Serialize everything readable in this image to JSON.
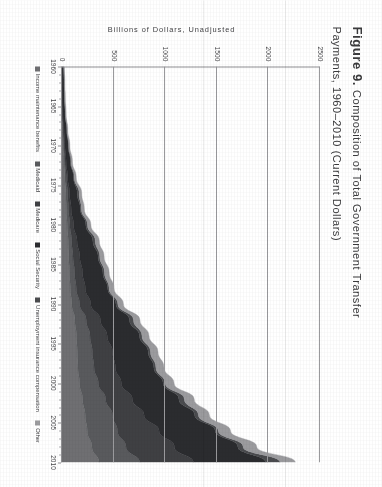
{
  "figure": {
    "number_label": "Figure 9.",
    "title_part_1": "Composition of Total Government Transfer",
    "title_part_2": "Payments, 1960–2010 (Current Dollars)"
  },
  "chart_data": {
    "type": "area",
    "stacked": true,
    "title": "Figure 9. Composition of Total Government Transfer Payments, 1960–2010 (Current Dollars)",
    "xlabel": "",
    "ylabel": "Billions of Dollars, Unadjusted",
    "ylim": [
      0,
      2500
    ],
    "xlim": [
      1960,
      2010
    ],
    "grid": "horizontal",
    "legend_position": "bottom",
    "y_ticks": [
      0,
      500,
      1000,
      1500,
      2000,
      2500
    ],
    "y_tick_labels": [
      "0",
      "500",
      "1000",
      "1500",
      "2000",
      "2500"
    ],
    "x_ticks": [
      1960,
      1965,
      1970,
      1975,
      1980,
      1985,
      1990,
      1995,
      2000,
      2005,
      2010
    ],
    "x_tick_labels": [
      "1960",
      "1965",
      "1970",
      "1975",
      "1980",
      "1985",
      "1990",
      "1995",
      "2000",
      "2005",
      "2010"
    ],
    "x": [
      1960,
      1962,
      1964,
      1966,
      1968,
      1970,
      1972,
      1974,
      1976,
      1978,
      1980,
      1982,
      1984,
      1986,
      1988,
      1990,
      1992,
      1994,
      1996,
      1998,
      2000,
      2002,
      2004,
      2006,
      2008,
      2010
    ],
    "series": [
      {
        "name": "Income maintenance benefits",
        "color": "#6f6f72",
        "values": [
          4,
          5,
          6,
          7,
          10,
          15,
          21,
          28,
          38,
          42,
          50,
          60,
          66,
          73,
          80,
          95,
          125,
          140,
          148,
          155,
          170,
          200,
          225,
          245,
          290,
          360
        ]
      },
      {
        "name": "Medicaid",
        "color": "#595a5d",
        "values": [
          0,
          0,
          0,
          1,
          4,
          6,
          9,
          13,
          17,
          21,
          27,
          34,
          41,
          49,
          58,
          76,
          110,
          132,
          146,
          156,
          183,
          224,
          265,
          293,
          331,
          395
        ]
      },
      {
        "name": "Medicare",
        "color": "#3f4043",
        "values": [
          0,
          0,
          0,
          2,
          6,
          8,
          10,
          15,
          19,
          26,
          36,
          52,
          66,
          77,
          88,
          108,
          138,
          166,
          196,
          207,
          222,
          259,
          306,
          403,
          468,
          520
        ]
      },
      {
        "name": "Social Security",
        "color": "#2b2c2f",
        "values": [
          11,
          15,
          17,
          21,
          26,
          32,
          41,
          56,
          74,
          89,
          118,
          153,
          177,
          197,
          217,
          244,
          281,
          313,
          345,
          372,
          405,
          450,
          490,
          544,
          615,
          700
        ]
      },
      {
        "name": "Unemployment insurance compensation",
        "color": "#4a4b4e",
        "values": [
          3,
          3,
          3,
          2,
          2,
          4,
          6,
          7,
          18,
          10,
          16,
          24,
          16,
          16,
          13,
          18,
          39,
          24,
          22,
          20,
          21,
          53,
          36,
          30,
          51,
          139
        ]
      },
      {
        "name": "Other",
        "color": "#9b9b9e",
        "values": [
          4,
          5,
          6,
          7,
          9,
          11,
          14,
          19,
          25,
          28,
          33,
          38,
          42,
          45,
          48,
          54,
          62,
          68,
          73,
          78,
          85,
          95,
          106,
          118,
          132,
          148
        ]
      }
    ],
    "totals_note": "Stacked total rises from about 22 billion in 1960 to about 2260 billion in 2010."
  },
  "legend": {
    "items": [
      {
        "label": "Income maintenance benefits",
        "color": "#6f6f72"
      },
      {
        "label": "Medicaid",
        "color": "#595a5d"
      },
      {
        "label": "Medicare",
        "color": "#3f4043"
      },
      {
        "label": "Social Security",
        "color": "#2b2c2f"
      },
      {
        "label": "Unemployment insurance compensation",
        "color": "#4a4b4e"
      },
      {
        "label": "Other",
        "color": "#9b9b9e"
      }
    ]
  }
}
